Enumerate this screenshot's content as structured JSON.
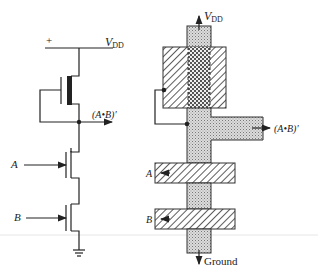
{
  "figure": {
    "type": "nMOS NAND gate: schematic and layout",
    "schematic": {
      "supply_plus": "+",
      "supply_label": "V",
      "supply_sub": "DD",
      "output_label": "(A•B)′",
      "inputs": [
        {
          "label": "A"
        },
        {
          "label": "B"
        }
      ],
      "ground_symbol": "ground-icon"
    },
    "layout": {
      "supply_label": "V",
      "supply_sub": "DD",
      "output_label": "(A•B)′",
      "inputs": [
        {
          "label": "A"
        },
        {
          "label": "B"
        }
      ],
      "ground_label": "Ground"
    },
    "colors": {
      "line": "#222222",
      "diffusion": "#cfcfcf",
      "background": "#ffffff"
    }
  }
}
